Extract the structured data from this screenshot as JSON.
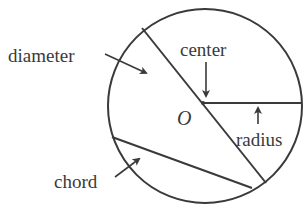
{
  "diagram": {
    "stroke_color": "#3a3a3a",
    "background": "#ffffff",
    "circle": {
      "cx": 205,
      "cy": 105,
      "r": 97
    },
    "center_point": {
      "x": 203,
      "y": 103,
      "label": "O"
    },
    "labels": {
      "diameter": "diameter",
      "center": "center",
      "radius": "radius",
      "chord": "chord",
      "center_name": "O"
    },
    "segments": {
      "diameter": {
        "x1": 142,
        "y1": 27,
        "x2": 266,
        "y2": 182
      },
      "radius": {
        "x1": 203,
        "y1": 103,
        "x2": 302,
        "y2": 103
      },
      "chord": {
        "x1": 112,
        "y1": 137,
        "x2": 252,
        "y2": 188
      }
    }
  }
}
